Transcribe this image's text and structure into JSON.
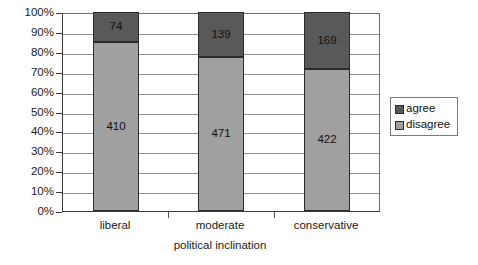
{
  "chart_data": {
    "type": "bar",
    "subtype": "stacked-100-percent",
    "title": "",
    "xlabel": "political inclination",
    "ylabel": "",
    "categories": [
      "liberal",
      "moderate",
      "conservative"
    ],
    "series": [
      {
        "name": "agree",
        "values": [
          74,
          139,
          169
        ],
        "color": "#595959"
      },
      {
        "name": "disagree",
        "values": [
          410,
          471,
          422
        ],
        "color": "#a0a0a0"
      }
    ],
    "stack_order_top_to_bottom": [
      "agree",
      "disagree"
    ],
    "percent_shares": {
      "liberal": {
        "agree": 15.3,
        "disagree": 84.7
      },
      "moderate": {
        "agree": 22.8,
        "disagree": 77.2
      },
      "conservative": {
        "agree": 28.6,
        "disagree": 71.4
      }
    },
    "ylim": [
      0,
      100
    ],
    "ytick_labels": [
      "100%",
      "90%",
      "80%",
      "70%",
      "60%",
      "50%",
      "40%",
      "30%",
      "20%",
      "10%",
      "0%"
    ],
    "ytick_values": [
      100,
      90,
      80,
      70,
      60,
      50,
      40,
      30,
      20,
      10,
      0
    ],
    "grid": true,
    "legend_position": "right"
  },
  "axis": {
    "y": {
      "ticks": [
        {
          "label": "100%",
          "value": 100
        },
        {
          "label": "90%",
          "value": 90
        },
        {
          "label": "80%",
          "value": 80
        },
        {
          "label": "70%",
          "value": 70
        },
        {
          "label": "60%",
          "value": 60
        },
        {
          "label": "50%",
          "value": 50
        },
        {
          "label": "40%",
          "value": 40
        },
        {
          "label": "30%",
          "value": 30
        },
        {
          "label": "20%",
          "value": 20
        },
        {
          "label": "10%",
          "value": 10
        },
        {
          "label": "0%",
          "value": 0
        }
      ]
    },
    "x": {
      "title": "political inclination",
      "categories": [
        "liberal",
        "moderate",
        "conservative"
      ]
    }
  },
  "bars": [
    {
      "category": "liberal",
      "segments": [
        {
          "series": "agree",
          "label": "74",
          "value": 74,
          "percent": 15.3,
          "color": "#595959"
        },
        {
          "series": "disagree",
          "label": "410",
          "value": 410,
          "percent": 84.7,
          "color": "#a0a0a0"
        }
      ]
    },
    {
      "category": "moderate",
      "segments": [
        {
          "series": "agree",
          "label": "139",
          "value": 139,
          "percent": 22.8,
          "color": "#595959"
        },
        {
          "series": "disagree",
          "label": "471",
          "value": 471,
          "percent": 77.2,
          "color": "#a0a0a0"
        }
      ]
    },
    {
      "category": "conservative",
      "segments": [
        {
          "series": "agree",
          "label": "169",
          "value": 169,
          "percent": 28.6,
          "color": "#595959"
        },
        {
          "series": "disagree",
          "label": "422",
          "value": 422,
          "percent": 71.4,
          "color": "#a0a0a0"
        }
      ]
    }
  ],
  "legend": {
    "items": [
      {
        "label": "agree",
        "color": "#595959"
      },
      {
        "label": "disagree",
        "color": "#a0a0a0"
      }
    ]
  }
}
